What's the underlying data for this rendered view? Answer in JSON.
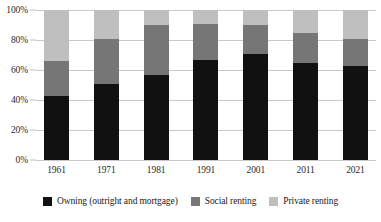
{
  "chart_data": {
    "type": "bar",
    "subtype": "stacked-bar-100-percent",
    "title": "",
    "subtitle": "",
    "xlabel": "",
    "ylabel": "",
    "categories": [
      "1961",
      "1971",
      "1981",
      "1991",
      "2001",
      "2011",
      "2021"
    ],
    "series": [
      {
        "name": "Owning (outright and mortgage)",
        "color": "#111111",
        "values": [
          43,
          51,
          57,
          67,
          71,
          65,
          63
        ]
      },
      {
        "name": "Social renting",
        "color": "#767676",
        "values": [
          23,
          30,
          33,
          24,
          19,
          20,
          18
        ]
      },
      {
        "name": "Private renting",
        "color": "#bfbfbf",
        "values": [
          34,
          19,
          10,
          9,
          10,
          15,
          19
        ]
      }
    ],
    "ylim": [
      0,
      100
    ],
    "y_ticks": [
      "0%",
      "20%",
      "40%",
      "60%",
      "80%",
      "100%"
    ],
    "y_tick_values": [
      0,
      20,
      40,
      60,
      80,
      100
    ],
    "grid": true,
    "grid_axis": "y",
    "legend_position": "bottom",
    "stack_order_bottom_to_top": [
      "Owning (outright and mortgage)",
      "Social renting",
      "Private renting"
    ]
  },
  "legend": {
    "items": [
      {
        "label": "Owning (outright and mortgage)",
        "color": "#111111"
      },
      {
        "label": "Social renting",
        "color": "#767676"
      },
      {
        "label": "Private renting",
        "color": "#bfbfbf"
      }
    ]
  },
  "colors": {
    "owning": "#111111",
    "social_renting": "#767676",
    "private_renting": "#bfbfbf",
    "gridline": "#c9c9c9",
    "background": "#ffffff",
    "text": "#1a1a1a"
  }
}
